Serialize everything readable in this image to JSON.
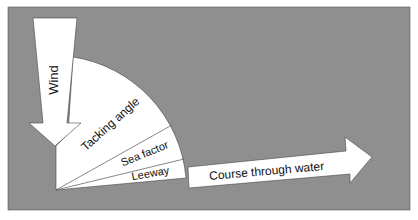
{
  "diagram": {
    "colors": {
      "background": "#8f8f8f",
      "shape_fill": "#ffffff",
      "stroke": "#333333",
      "text": "#111111"
    },
    "labels": {
      "wind": "Wind",
      "tacking_angle": "Tacking angle",
      "sea_factor": "Sea factor",
      "leeway": "Leeway",
      "course": "Course through water"
    }
  }
}
